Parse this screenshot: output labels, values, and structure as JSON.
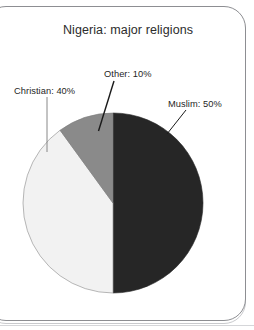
{
  "frame": {
    "border_color": "#8d8e92",
    "background": "#ffffff"
  },
  "chart_data": {
    "type": "pie",
    "title": "Nigeria: major religions",
    "xlabel": "",
    "ylabel": "",
    "legend_position": "callout-labels",
    "grid": false,
    "start_angle_deg": 0,
    "direction": "clockwise",
    "unit": "%",
    "categories": [
      "Muslim",
      "Christian",
      "Other"
    ],
    "values": [
      50,
      40,
      10
    ],
    "slices": [
      {
        "name": "Muslim",
        "value": 50,
        "label": "Muslim: 50%",
        "color": "#262626",
        "start_deg": 0,
        "end_deg": 180
      },
      {
        "name": "Christian",
        "value": 40,
        "label": "Christian: 40%",
        "color": "#f2f2f2",
        "start_deg": 180,
        "end_deg": 324
      },
      {
        "name": "Other",
        "value": 10,
        "label": "Other: 10%",
        "color": "#8a8a8a",
        "start_deg": 324,
        "end_deg": 360
      }
    ]
  },
  "labels": {
    "christian": "Christian: 40%",
    "other": "Other: 10%",
    "muslim": "Muslim: 50%"
  }
}
